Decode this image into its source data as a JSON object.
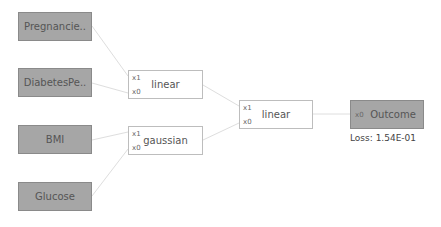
{
  "inputs": [
    {
      "label": "Pregnancie.."
    },
    {
      "label": "DiabetesPe.."
    },
    {
      "label": "BMI"
    },
    {
      "label": "Glucose"
    }
  ],
  "ops": [
    {
      "label": "linear",
      "ports": [
        "x1",
        "x0"
      ]
    },
    {
      "label": "gaussian",
      "ports": [
        "x1",
        "x0"
      ]
    },
    {
      "label": "linear",
      "ports": [
        "x1",
        "x0"
      ]
    }
  ],
  "output": {
    "label": "Outcome",
    "port": "x0",
    "loss": "Loss: 1.54E-01"
  },
  "colors": {
    "input_fill": "#a6a6a6",
    "edge": "#e0e0e0",
    "op_border": "#bdbdbd"
  }
}
